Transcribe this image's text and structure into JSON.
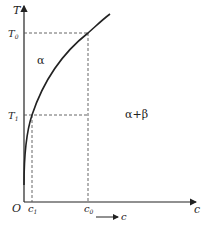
{
  "diagram": {
    "type": "phase-diagram-solvus",
    "axes": {
      "y_label": "T",
      "x_label": "c",
      "origin_label": "O"
    },
    "y_ticks": [
      {
        "label": "T",
        "sub": "0"
      },
      {
        "label": "T",
        "sub": "1"
      }
    ],
    "x_ticks": [
      {
        "label": "c",
        "sub": "1"
      },
      {
        "label": "c",
        "sub": "0"
      }
    ],
    "regions": {
      "left": "α",
      "right": "α+β"
    },
    "arrow_label": "c",
    "colors": {
      "line": "#222222",
      "dashed": "#555555",
      "background": "#ffffff"
    }
  }
}
